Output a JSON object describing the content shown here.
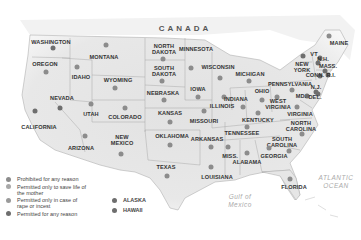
{
  "country_label": "CANADA",
  "water_labels": [
    {
      "id": "atlantic",
      "text": "ATLANTIC\nOCEAN",
      "x": 336,
      "y": 182
    },
    {
      "id": "gulf",
      "text": "Gulf of\nMexico",
      "x": 240,
      "y": 201
    }
  ],
  "colors": {
    "prohibited": "#8c8c8c",
    "save_life": "#a8a8a8",
    "rape_incest": "#9a9a9a",
    "any_reason": "#6e6e6e",
    "land": "#e6e6e6",
    "border": "#9a9a9a"
  },
  "legend": [
    {
      "key": "prohibited",
      "label": "Prohibited for any reason"
    },
    {
      "key": "save_life",
      "label": "Permitted only to save life of the mother"
    },
    {
      "key": "rape_incest",
      "label": "Permitted only in case of rape or incest"
    },
    {
      "key": "any_reason",
      "label": "Permitted for any reason"
    }
  ],
  "legend_extra": [
    {
      "key": "any_reason",
      "label": "ALASKA"
    },
    {
      "key": "any_reason",
      "label": "HAWAII"
    }
  ],
  "states": [
    {
      "name": "WASHINGTON",
      "lx": 51,
      "ly": 42,
      "dx": 53,
      "dy": 48,
      "key": "any_reason"
    },
    {
      "name": "OREGON",
      "lx": 45,
      "ly": 64,
      "dx": 46,
      "dy": 72,
      "key": "prohibited"
    },
    {
      "name": "IDAHO",
      "lx": 81,
      "ly": 77,
      "dx": 77,
      "dy": 67,
      "key": "prohibited"
    },
    {
      "name": "MONTANA",
      "lx": 104,
      "ly": 57,
      "dx": 106,
      "dy": 45,
      "key": "prohibited"
    },
    {
      "name": "WYOMING",
      "lx": 118,
      "ly": 80,
      "dx": 115,
      "dy": 88,
      "key": "prohibited"
    },
    {
      "name": "NORTH\nDAKOTA",
      "lx": 164,
      "ly": 49,
      "dx": 163,
      "dy": 59,
      "key": "prohibited"
    },
    {
      "name": "SOUTH\nDAKOTA",
      "lx": 164,
      "ly": 71,
      "dx": 162,
      "dy": 81,
      "key": "prohibited"
    },
    {
      "name": "MINNESOTA",
      "lx": 196,
      "ly": 49,
      "dx": 191,
      "dy": 68,
      "key": "prohibited"
    },
    {
      "name": "WISCONSIN",
      "lx": 218,
      "ly": 67,
      "dx": 220,
      "dy": 78,
      "key": "prohibited"
    },
    {
      "name": "MICHIGAN",
      "lx": 250,
      "ly": 74,
      "dx": 249,
      "dy": 81,
      "key": "prohibited"
    },
    {
      "name": "NEVADA",
      "lx": 62,
      "ly": 98,
      "dx": 60,
      "dy": 108,
      "key": "any_reason"
    },
    {
      "name": "UTAH",
      "lx": 91,
      "ly": 114,
      "dx": 91,
      "dy": 104,
      "key": "prohibited"
    },
    {
      "name": "COLORADO",
      "lx": 125,
      "ly": 117,
      "dx": 125,
      "dy": 108,
      "key": "prohibited"
    },
    {
      "name": "CALIFORNIA",
      "lx": 39,
      "ly": 127,
      "dx": 35,
      "dy": 111,
      "key": "any_reason"
    },
    {
      "name": "NEBRASKA",
      "lx": 163,
      "ly": 93,
      "dx": 164,
      "dy": 100,
      "key": "prohibited"
    },
    {
      "name": "IOWA",
      "lx": 198,
      "ly": 89,
      "dx": 198,
      "dy": 97,
      "key": "prohibited"
    },
    {
      "name": "KANSAS",
      "lx": 170,
      "ly": 113,
      "dx": 170,
      "dy": 122,
      "key": "prohibited"
    },
    {
      "name": "ARIZONA",
      "lx": 81,
      "ly": 148,
      "dx": 85,
      "dy": 136,
      "key": "prohibited"
    },
    {
      "name": "NEW\nMEXICO",
      "lx": 122,
      "ly": 140,
      "dx": 121,
      "dy": 154,
      "key": "prohibited"
    },
    {
      "name": "OKLAHOMA",
      "lx": 172,
      "ly": 136,
      "dx": 170,
      "dy": 145,
      "key": "prohibited"
    },
    {
      "name": "TEXAS",
      "lx": 166,
      "ly": 167,
      "dx": 167,
      "dy": 176,
      "key": "prohibited"
    },
    {
      "name": "ILLINOIS",
      "lx": 222,
      "ly": 106,
      "dx": 224,
      "dy": 97,
      "key": "prohibited"
    },
    {
      "name": "INDIANA",
      "lx": 236,
      "ly": 99,
      "dx": 243,
      "dy": 107,
      "key": "prohibited"
    },
    {
      "name": "OHIO",
      "lx": 262,
      "ly": 91,
      "dx": 262,
      "dy": 100,
      "key": "prohibited"
    },
    {
      "name": "MISSOURI",
      "lx": 204,
      "ly": 121,
      "dx": 204,
      "dy": 111,
      "key": "prohibited"
    },
    {
      "name": "KENTUCKY",
      "lx": 258,
      "ly": 120,
      "dx": 258,
      "dy": 113,
      "key": "prohibited"
    },
    {
      "name": "WEST\nVIRGINIA",
      "lx": 278,
      "ly": 104,
      "dx": 277,
      "dy": 97,
      "key": "prohibited"
    },
    {
      "name": "VIRGINIA",
      "lx": 300,
      "ly": 114,
      "dx": 297,
      "dy": 107,
      "key": "prohibited"
    },
    {
      "name": "PENNSYLVANIA",
      "lx": 290,
      "ly": 84,
      "dx": 292,
      "dy": 90,
      "key": "prohibited"
    },
    {
      "name": "NEW\nYORK",
      "lx": 302,
      "ly": 67,
      "dx": 303,
      "dy": 56,
      "key": "any_reason"
    },
    {
      "name": "VT",
      "lx": 314,
      "ly": 54,
      "dx": 320,
      "dy": 58,
      "key": "any_reason"
    },
    {
      "name": "N.H.",
      "lx": 323,
      "ly": 59,
      "dx": 318,
      "dy": 63,
      "key": "any_reason"
    },
    {
      "name": "MASS.",
      "lx": 328,
      "ly": 66,
      "dx": 325,
      "dy": 71,
      "key": "any_reason"
    },
    {
      "name": "CONN.",
      "lx": 315,
      "ly": 75,
      "dx": 320,
      "dy": 76,
      "key": "any_reason"
    },
    {
      "name": "R.I.",
      "lx": 331,
      "ly": 75,
      "dx": 328,
      "dy": 75,
      "key": "any_reason"
    },
    {
      "name": "MAINE",
      "lx": 339,
      "ly": 43,
      "dx": 329,
      "dy": 36,
      "key": "prohibited"
    },
    {
      "name": "N.J.",
      "lx": 316,
      "ly": 87,
      "dx": 316,
      "dy": 92,
      "key": "any_reason"
    },
    {
      "name": "MD.",
      "lx": 301,
      "ly": 96,
      "dx": 307,
      "dy": 96,
      "key": "any_reason"
    },
    {
      "name": "DEL.",
      "lx": 315,
      "ly": 97,
      "dx": 318,
      "dy": 94,
      "key": "any_reason"
    },
    {
      "name": "TENNESSEE",
      "lx": 242,
      "ly": 133,
      "dx": 247,
      "dy": 127,
      "key": "prohibited"
    },
    {
      "name": "NORTH\nCAROLINA",
      "lx": 301,
      "ly": 126,
      "dx": 302,
      "dy": 134,
      "key": "prohibited"
    },
    {
      "name": "ARKANSAS",
      "lx": 207,
      "ly": 139,
      "dx": 211,
      "dy": 147,
      "key": "prohibited"
    },
    {
      "name": "SOUTH\nCAROLINA",
      "lx": 282,
      "ly": 142,
      "dx": 289,
      "dy": 151,
      "key": "prohibited"
    },
    {
      "name": "MISS.",
      "lx": 230,
      "ly": 156,
      "dx": 228,
      "dy": 147,
      "key": "prohibited"
    },
    {
      "name": "ALABAMA",
      "lx": 247,
      "ly": 162,
      "dx": 247,
      "dy": 153,
      "key": "prohibited"
    },
    {
      "name": "GEORGIA",
      "lx": 274,
      "ly": 156,
      "dx": 269,
      "dy": 148,
      "key": "prohibited"
    },
    {
      "name": "LOUISIANA",
      "lx": 217,
      "ly": 177,
      "dx": 211,
      "dy": 167,
      "key": "prohibited"
    },
    {
      "name": "FLORIDA",
      "lx": 294,
      "ly": 187,
      "dx": 290,
      "dy": 179,
      "key": "prohibited"
    }
  ]
}
